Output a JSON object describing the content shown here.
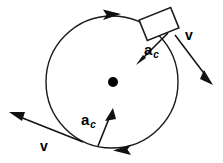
{
  "diagram": {
    "colors": {
      "stroke": "#1a1a1a",
      "background": "#ffffff",
      "center_dot": "#000000"
    },
    "circle": {
      "center_x": 112,
      "center_y": 82,
      "radius": 66,
      "rotation_sense": "clockwise"
    },
    "center_point": {
      "name": "center-dot",
      "x": 113,
      "y": 82,
      "radius": 5
    },
    "object_box": {
      "name": "moving-object",
      "center_x": 159,
      "center_y": 24,
      "width": 32,
      "height": 20,
      "angle_deg": -22
    },
    "labels": {
      "ac_top": {
        "symbol": "a",
        "subscript": "c"
      },
      "ac_bottom": {
        "symbol": "a",
        "subscript": "c"
      },
      "v_right": {
        "symbol": "v"
      },
      "v_left": {
        "symbol": "v"
      }
    },
    "vectors": [
      {
        "name": "centripetal-acceleration-top",
        "label": "a_c",
        "from_x": 167,
        "from_y": 34,
        "to_x": 139,
        "to_y": 62,
        "kind": "acceleration"
      },
      {
        "name": "velocity-top-right",
        "label": "v",
        "from_x": 176,
        "from_y": 36,
        "to_x": 212,
        "to_y": 82,
        "kind": "velocity"
      },
      {
        "name": "centripetal-acceleration-bottom",
        "label": "a_c",
        "from_x": 97,
        "from_y": 147,
        "to_x": 113,
        "to_y": 111,
        "kind": "acceleration"
      },
      {
        "name": "velocity-bottom-left",
        "label": "v",
        "from_x": 82,
        "from_y": 142,
        "to_x": 10,
        "to_y": 113,
        "kind": "velocity"
      }
    ],
    "path_arrowheads": [
      {
        "name": "path-arrow-top",
        "x": 113,
        "y": 16,
        "direction": "clockwise-right"
      },
      {
        "name": "path-arrow-bottom",
        "x": 122,
        "y": 148,
        "direction": "clockwise-left"
      }
    ]
  }
}
